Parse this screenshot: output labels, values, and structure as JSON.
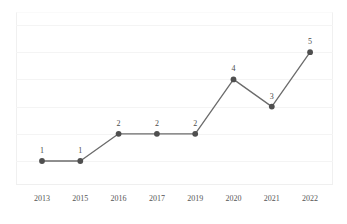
{
  "chart_data": {
    "type": "line",
    "title": "",
    "subtitle": "",
    "xlabel": "",
    "ylabel": "",
    "categories": [
      "2013",
      "2015",
      "2016",
      "2017",
      "2019",
      "2020",
      "2021",
      "2022"
    ],
    "values": [
      1,
      1,
      2,
      2,
      2,
      4,
      3,
      5
    ],
    "point_labels": [
      "1",
      "1",
      "2",
      "2",
      "2",
      "4",
      "3",
      "5"
    ],
    "series": [
      {
        "name": "",
        "values": [
          1,
          1,
          2,
          2,
          2,
          4,
          3,
          5
        ]
      }
    ],
    "xlim": [
      0,
      7
    ],
    "ylim": [
      0,
      6
    ],
    "y_gridline_values": [
      6,
      5,
      4,
      3,
      2,
      1
    ],
    "grid": true,
    "grid_axis": "y",
    "legend": false,
    "legend_position": "none",
    "show_data_labels": true,
    "marker": "circle",
    "colors": {
      "line": "#6b6b6b",
      "marker": "#4f4f4f",
      "label_text": "#4a4a4a",
      "tick_text": "#555555",
      "gridline": "#f4f4f4",
      "axis": "#efefef",
      "background": "#ffffff"
    }
  },
  "axes": {
    "x_ticks": [
      "2013",
      "2015",
      "2016",
      "2017",
      "2019",
      "2020",
      "2021",
      "2022"
    ],
    "y_ticks": []
  }
}
